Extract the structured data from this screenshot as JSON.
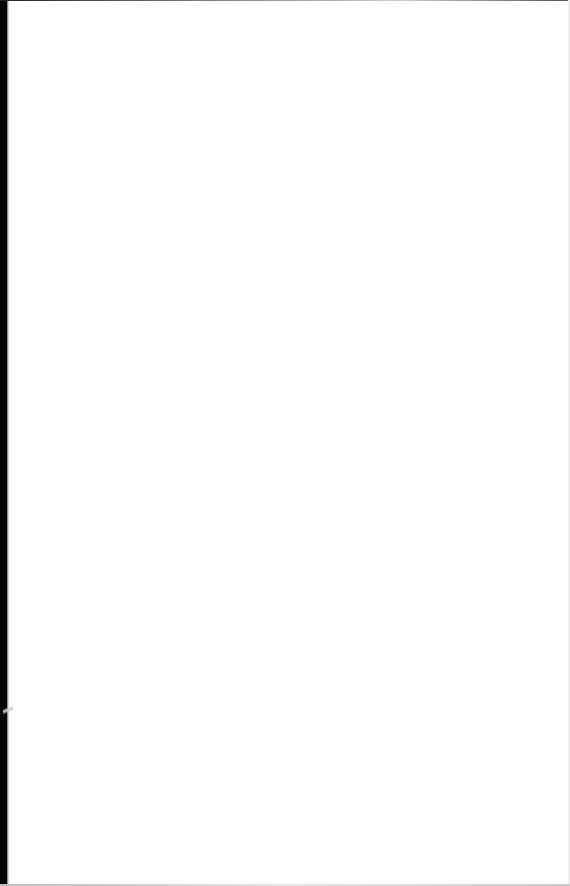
{
  "document": {
    "type": "scanned-page",
    "content": "blank",
    "background_color": "#ffffff",
    "edge_color": "#050505"
  }
}
